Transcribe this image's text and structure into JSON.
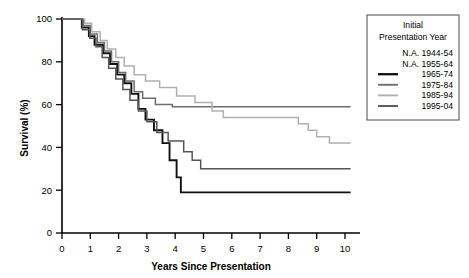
{
  "chart_data": {
    "type": "line",
    "title": "",
    "xlabel": "Years Since Presentation",
    "ylabel": "Survival (%)",
    "xlim": [
      0,
      10.5
    ],
    "ylim": [
      0,
      100
    ],
    "xticks": [
      0,
      1,
      2,
      3,
      4,
      5,
      6,
      7,
      8,
      9,
      10
    ],
    "yticks": [
      0,
      20,
      40,
      60,
      80,
      100
    ],
    "grid": false,
    "legend_position": "top-right",
    "legend_title_lines": [
      "Initial",
      "Presentation Year"
    ],
    "series": [
      {
        "name": "N.A. 1944-54",
        "available": false,
        "color": "#000000",
        "width": 0,
        "points": []
      },
      {
        "name": "N.A. 1955-64",
        "available": false,
        "color": "#000000",
        "width": 0,
        "points": []
      },
      {
        "name": "1965-74",
        "available": true,
        "color": "#111111",
        "width": 1.9,
        "points": [
          [
            0.0,
            100
          ],
          [
            0.7,
            100
          ],
          [
            0.7,
            96
          ],
          [
            0.95,
            96
          ],
          [
            0.95,
            92
          ],
          [
            1.15,
            92
          ],
          [
            1.15,
            88
          ],
          [
            1.45,
            88
          ],
          [
            1.45,
            84
          ],
          [
            1.7,
            84
          ],
          [
            1.7,
            79
          ],
          [
            1.95,
            79
          ],
          [
            1.95,
            74
          ],
          [
            2.2,
            74
          ],
          [
            2.2,
            70
          ],
          [
            2.45,
            70
          ],
          [
            2.45,
            65
          ],
          [
            2.7,
            65
          ],
          [
            2.7,
            58
          ],
          [
            2.95,
            58
          ],
          [
            2.95,
            53
          ],
          [
            3.25,
            53
          ],
          [
            3.25,
            48
          ],
          [
            3.55,
            48
          ],
          [
            3.55,
            42
          ],
          [
            3.8,
            42
          ],
          [
            3.8,
            34
          ],
          [
            4.05,
            34
          ],
          [
            4.05,
            26
          ],
          [
            4.2,
            26
          ],
          [
            4.2,
            19
          ],
          [
            10.2,
            19
          ]
        ]
      },
      {
        "name": "1975-84",
        "available": true,
        "color": "#6e6e6e",
        "width": 1.5,
        "points": [
          [
            0.0,
            100
          ],
          [
            0.75,
            100
          ],
          [
            0.75,
            97
          ],
          [
            1.0,
            97
          ],
          [
            1.0,
            93
          ],
          [
            1.25,
            93
          ],
          [
            1.25,
            89
          ],
          [
            1.5,
            89
          ],
          [
            1.5,
            85
          ],
          [
            1.75,
            85
          ],
          [
            1.75,
            80
          ],
          [
            2.0,
            80
          ],
          [
            2.0,
            75
          ],
          [
            2.25,
            75
          ],
          [
            2.25,
            71
          ],
          [
            2.55,
            71
          ],
          [
            2.55,
            66
          ],
          [
            2.85,
            66
          ],
          [
            2.85,
            63
          ],
          [
            3.3,
            63
          ],
          [
            3.3,
            60
          ],
          [
            3.9,
            60
          ],
          [
            3.9,
            59
          ],
          [
            10.2,
            59
          ]
        ]
      },
      {
        "name": "1985-94",
        "available": true,
        "color": "#b0b0b0",
        "width": 1.5,
        "points": [
          [
            0.0,
            100
          ],
          [
            0.8,
            100
          ],
          [
            0.8,
            98
          ],
          [
            1.05,
            98
          ],
          [
            1.05,
            94
          ],
          [
            1.35,
            94
          ],
          [
            1.35,
            90
          ],
          [
            1.6,
            90
          ],
          [
            1.6,
            86
          ],
          [
            1.9,
            86
          ],
          [
            1.9,
            82
          ],
          [
            2.2,
            82
          ],
          [
            2.2,
            78
          ],
          [
            2.55,
            78
          ],
          [
            2.55,
            74
          ],
          [
            2.95,
            74
          ],
          [
            2.95,
            71
          ],
          [
            3.45,
            71
          ],
          [
            3.45,
            68
          ],
          [
            4.05,
            68
          ],
          [
            4.05,
            64
          ],
          [
            4.7,
            64
          ],
          [
            4.7,
            61
          ],
          [
            5.3,
            61
          ],
          [
            5.3,
            57
          ],
          [
            5.7,
            57
          ],
          [
            5.7,
            54
          ],
          [
            8.35,
            54
          ],
          [
            8.35,
            51
          ],
          [
            8.7,
            51
          ],
          [
            8.7,
            48
          ],
          [
            9.0,
            48
          ],
          [
            9.0,
            45
          ],
          [
            9.45,
            45
          ],
          [
            9.45,
            42
          ],
          [
            10.2,
            42
          ]
        ]
      },
      {
        "name": "1995-04",
        "available": true,
        "color": "#555555",
        "width": 1.5,
        "points": [
          [
            0.0,
            100
          ],
          [
            0.72,
            100
          ],
          [
            0.72,
            95
          ],
          [
            0.98,
            95
          ],
          [
            0.98,
            91
          ],
          [
            1.2,
            91
          ],
          [
            1.2,
            87
          ],
          [
            1.42,
            87
          ],
          [
            1.42,
            82
          ],
          [
            1.65,
            82
          ],
          [
            1.65,
            77
          ],
          [
            1.9,
            77
          ],
          [
            1.9,
            72
          ],
          [
            2.15,
            72
          ],
          [
            2.15,
            67
          ],
          [
            2.4,
            67
          ],
          [
            2.4,
            62
          ],
          [
            2.7,
            62
          ],
          [
            2.7,
            57
          ],
          [
            3.0,
            57
          ],
          [
            3.0,
            52
          ],
          [
            3.35,
            52
          ],
          [
            3.35,
            47
          ],
          [
            3.75,
            47
          ],
          [
            3.75,
            43
          ],
          [
            4.3,
            43
          ],
          [
            4.3,
            38
          ],
          [
            4.6,
            38
          ],
          [
            4.6,
            34
          ],
          [
            4.9,
            34
          ],
          [
            4.9,
            30
          ],
          [
            10.2,
            30
          ]
        ]
      }
    ]
  },
  "legend": {
    "title_line1": "Initial",
    "title_line2": "Presentation Year",
    "entries": [
      {
        "label": "N.A. 1944-54",
        "has_swatch": false
      },
      {
        "label": "N.A. 1955-64",
        "has_swatch": false
      },
      {
        "label": "1965-74",
        "has_swatch": true
      },
      {
        "label": "1975-84",
        "has_swatch": true
      },
      {
        "label": "1985-94",
        "has_swatch": true
      },
      {
        "label": "1995-04",
        "has_swatch": true
      }
    ]
  },
  "axes": {
    "y_title": "Survival (%)",
    "x_title": "Years Since Presentation",
    "y_tick_labels": [
      "100",
      "80",
      "60",
      "40",
      "20",
      "0"
    ],
    "x_tick_labels": [
      "0",
      "1",
      "2",
      "3",
      "4",
      "5",
      "6",
      "7",
      "8",
      "9",
      "10"
    ]
  },
  "colors": {
    "axis": "#000000",
    "c1965": "#111111",
    "c1975": "#6e6e6e",
    "c1985": "#b0b0b0",
    "c1995": "#555555",
    "legend_border": "#4a4a4a"
  }
}
